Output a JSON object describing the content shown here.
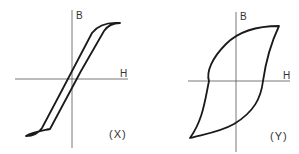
{
  "diagrams": [
    {
      "id": "X",
      "caption": "(X)",
      "axis_labels": {
        "vertical": "B",
        "horizontal": "H"
      },
      "description": "Narrow hysteresis loop (B vs H)"
    },
    {
      "id": "Y",
      "caption": "(Y)",
      "axis_labels": {
        "vertical": "B",
        "horizontal": "H"
      },
      "description": "Wide hysteresis loop (B vs H)"
    }
  ],
  "colors": {
    "line": "#1a1a1a",
    "axis": "#444444",
    "background": "#ffffff"
  }
}
